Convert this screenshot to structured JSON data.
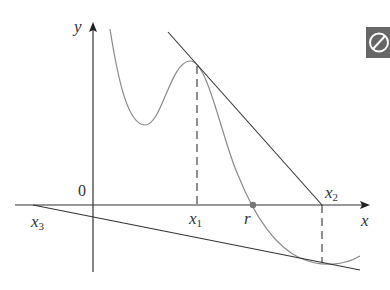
{
  "figure": {
    "axes": {
      "x_label": "x",
      "y_label": "y",
      "origin_label": "0"
    },
    "points": {
      "x1": {
        "label": "x",
        "sub": "1"
      },
      "x2": {
        "label": "x",
        "sub": "2"
      },
      "x3": {
        "label": "x",
        "sub": "3"
      },
      "r": {
        "label": "r"
      }
    },
    "colors": {
      "curve": "#8a8a8a",
      "lines": "#333333",
      "root_dot": "#777777",
      "icon_bg": "#666666"
    },
    "icon": {
      "name": "no-entry-icon",
      "glyph": "⊘"
    }
  }
}
